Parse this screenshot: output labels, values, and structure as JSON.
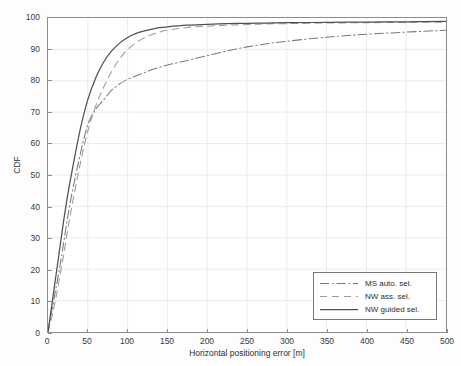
{
  "chart_data": {
    "type": "line",
    "title": "",
    "xlabel": "Horizontal positioning error [m]",
    "ylabel": "CDF",
    "xlim": [
      0,
      500
    ],
    "ylim": [
      0,
      100
    ],
    "xticks": [
      0,
      50,
      100,
      150,
      200,
      250,
      300,
      350,
      400,
      450,
      500
    ],
    "yticks": [
      0,
      10,
      20,
      30,
      40,
      50,
      60,
      70,
      80,
      90,
      100
    ],
    "grid": true,
    "legend_position": "lower right",
    "x": [
      0,
      5,
      10,
      15,
      20,
      25,
      30,
      40,
      50,
      60,
      70,
      80,
      90,
      100,
      110,
      120,
      130,
      140,
      150,
      175,
      200,
      225,
      250,
      275,
      300,
      350,
      400,
      450,
      500
    ],
    "series": [
      {
        "name": "MS auto. sel.",
        "style": "dashdot",
        "color": "#7a7a7a",
        "values": [
          0,
          7,
          14,
          21,
          29,
          37,
          44,
          56,
          66,
          71,
          74,
          77,
          79,
          80.5,
          81.5,
          82.5,
          83.5,
          84.3,
          85,
          86.5,
          88,
          89.5,
          90.8,
          91.8,
          92.6,
          93.9,
          94.8,
          95.5,
          96.1
        ]
      },
      {
        "name": "NW ass. sel.",
        "style": "dashed",
        "color": "#9a9a9a",
        "values": [
          0,
          5,
          11,
          18,
          25,
          33,
          40,
          53,
          64,
          72,
          78,
          83,
          87,
          90,
          92,
          93.6,
          94.7,
          95.5,
          96.1,
          97.0,
          97.4,
          97.7,
          97.9,
          98.1,
          98.2,
          98.4,
          98.5,
          98.6,
          98.7
        ]
      },
      {
        "name": "NW guided sel.",
        "style": "solid",
        "color": "#4f4f4f",
        "values": [
          0,
          9,
          18,
          27,
          36,
          44,
          51,
          64,
          74,
          81,
          86,
          89.5,
          92,
          93.8,
          95,
          95.8,
          96.4,
          96.9,
          97.2,
          97.7,
          98.0,
          98.2,
          98.3,
          98.4,
          98.5,
          98.6,
          98.7,
          98.8,
          98.9
        ]
      }
    ]
  },
  "colors": {
    "grid": "#ebebeb",
    "axis": "#8c8c8c",
    "text": "#2e2e2e",
    "background": "#ffffff"
  }
}
